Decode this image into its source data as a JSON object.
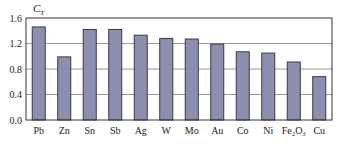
{
  "chart_data": {
    "type": "bar",
    "title": "",
    "xlabel": "",
    "ylabel": "C",
    "ylabel_subscript": "T",
    "categories": [
      "Pb",
      "Zn",
      "Sn",
      "Sb",
      "Ag",
      "W",
      "Mo",
      "Au",
      "Co",
      "Ni",
      "Fe2O3",
      "Cu"
    ],
    "category_display": [
      "Pb",
      "Zn",
      "Sn",
      "Sb",
      "Ag",
      "W",
      "Mo",
      "Au",
      "Co",
      "Ni",
      "Fe₂O₃",
      "Cu"
    ],
    "values": [
      1.46,
      0.99,
      1.42,
      1.42,
      1.33,
      1.28,
      1.27,
      1.19,
      1.07,
      1.05,
      0.91,
      0.68
    ],
    "ylim": [
      0.0,
      1.6
    ],
    "yticks": [
      0.0,
      0.4,
      0.8,
      1.2,
      1.6
    ],
    "ytick_labels": [
      "0.0",
      "0.4",
      "0.8",
      "1.2",
      "1.6"
    ],
    "grid": true,
    "legend": null,
    "colors": {
      "bar_fill": "#8c90ae",
      "bar_edge": "#3a3a46",
      "grid": "#9a9a9a",
      "axis": "#333333"
    }
  }
}
